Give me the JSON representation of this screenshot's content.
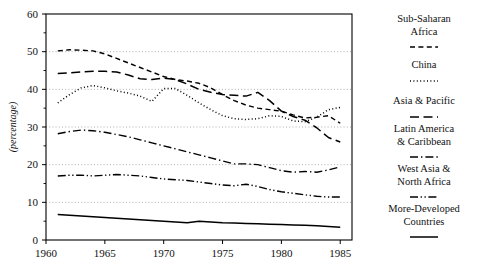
{
  "chart_data": {
    "type": "line",
    "title": "",
    "xlabel": "",
    "ylabel": "(percentage)",
    "xlim": [
      1960,
      1986
    ],
    "ylim": [
      0,
      60
    ],
    "xticks": [
      "1960",
      "1965",
      "1970",
      "1975",
      "1980",
      "1985"
    ],
    "yticks": [
      "0",
      "10",
      "20",
      "30",
      "40",
      "50",
      "60"
    ],
    "grid": "horizontal-dotted",
    "legend_position": "right",
    "x": [
      1961,
      1962,
      1963,
      1964,
      1965,
      1966,
      1967,
      1968,
      1969,
      1970,
      1971,
      1972,
      1973,
      1974,
      1975,
      1976,
      1977,
      1978,
      1979,
      1980,
      1981,
      1982,
      1983,
      1984,
      1985
    ],
    "series": [
      {
        "name": "Sub-Saharan Africa",
        "dash": "dashed-short",
        "values": [
          50.2,
          50.5,
          50.4,
          50.2,
          49.4,
          48.2,
          47.0,
          45.8,
          44.6,
          43.4,
          42.6,
          42.2,
          41.6,
          40.4,
          38.6,
          37.0,
          35.8,
          35.0,
          34.6,
          34.2,
          33.2,
          32.4,
          32.6,
          33.0,
          31.0
        ]
      },
      {
        "name": "China",
        "dash": "dotted",
        "values": [
          36.4,
          38.6,
          40.4,
          41.0,
          40.4,
          39.6,
          39.0,
          38.2,
          36.8,
          40.2,
          40.2,
          38.4,
          36.4,
          34.6,
          33.0,
          32.2,
          32.0,
          32.2,
          33.0,
          32.8,
          31.6,
          31.4,
          32.6,
          34.6,
          35.2
        ]
      },
      {
        "name": "Asia & Pacific",
        "dash": "dashed-long",
        "values": [
          44.2,
          44.4,
          44.6,
          44.8,
          44.8,
          44.6,
          43.8,
          42.8,
          42.6,
          43.0,
          42.6,
          41.4,
          40.0,
          39.2,
          38.6,
          38.4,
          38.2,
          39.2,
          37.0,
          34.2,
          32.8,
          31.8,
          29.8,
          27.2,
          26.0
        ]
      },
      {
        "name": "Latin America & Caribbean",
        "dash": "dash-dot",
        "values": [
          28.2,
          28.8,
          29.2,
          29.0,
          28.6,
          28.0,
          27.4,
          26.6,
          25.8,
          25.0,
          24.2,
          23.4,
          22.6,
          21.8,
          21.0,
          20.2,
          20.2,
          20.0,
          19.2,
          18.4,
          18.0,
          18.2,
          18.0,
          18.6,
          19.4
        ]
      },
      {
        "name": "West Asia & North Africa",
        "dash": "dash-dot-dot",
        "values": [
          17.0,
          17.2,
          17.2,
          17.0,
          17.2,
          17.4,
          17.2,
          17.0,
          16.6,
          16.2,
          16.0,
          15.8,
          15.4,
          15.0,
          14.6,
          14.4,
          14.8,
          14.2,
          13.4,
          12.8,
          12.4,
          12.0,
          11.6,
          11.4,
          11.4
        ]
      },
      {
        "name": "More-Developed Countries",
        "dash": "solid",
        "values": [
          6.8,
          6.6,
          6.4,
          6.2,
          6.0,
          5.8,
          5.6,
          5.4,
          5.2,
          5.0,
          4.8,
          4.6,
          5.0,
          4.8,
          4.6,
          4.5,
          4.4,
          4.3,
          4.2,
          4.1,
          4.0,
          3.9,
          3.8,
          3.6,
          3.4
        ]
      }
    ]
  },
  "legend": {
    "items": [
      {
        "label_line1": "Sub-Saharan",
        "label_line2": "Africa",
        "key": "sub-saharan-africa"
      },
      {
        "label_line1": "China",
        "label_line2": "",
        "key": "china"
      },
      {
        "label_line1": "Asia & Pacific",
        "label_line2": "",
        "key": "asia-pacific"
      },
      {
        "label_line1": "Latin America",
        "label_line2": "& Caribbean",
        "key": "latin-america-caribbean"
      },
      {
        "label_line1": "West Asia &",
        "label_line2": "North Africa",
        "key": "west-asia-north-africa"
      },
      {
        "label_line1": "More-Developed",
        "label_line2": "Countries",
        "key": "more-developed-countries"
      }
    ]
  },
  "colors": {
    "line": "#000000",
    "grid": "#999999",
    "axis": "#000000",
    "background": "#ffffff"
  }
}
